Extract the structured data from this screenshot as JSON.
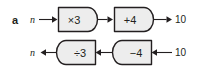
{
  "figure": {
    "part_label": "a",
    "type": "function-machine-flow-diagram",
    "rows": [
      {
        "id": "forward",
        "direction": "left-to-right",
        "input_label": "n",
        "output_label": "10",
        "machines": [
          {
            "id": "multiply-by-3",
            "label": "×3"
          },
          {
            "id": "add-4",
            "label": "+4"
          }
        ]
      },
      {
        "id": "inverse",
        "direction": "right-to-left",
        "input_label": "10",
        "output_label": "n",
        "machines": [
          {
            "id": "divide-by-3",
            "label": "÷3"
          },
          {
            "id": "subtract-4",
            "label": "−4"
          }
        ]
      }
    ]
  },
  "colors": {
    "ink": "#231f20",
    "machine_fill": "#ededed",
    "background": "#ffffff"
  }
}
